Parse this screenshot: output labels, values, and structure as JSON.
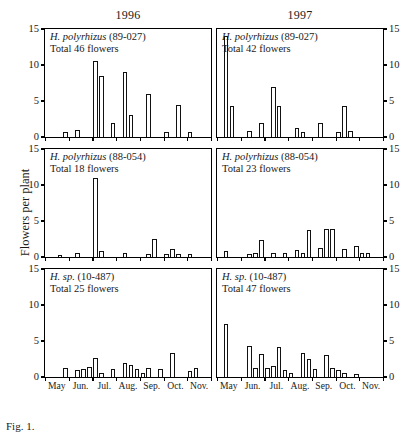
{
  "figure": {
    "ylabel": "Flowers per plant",
    "columns": [
      {
        "key": "c1996",
        "label": "1996"
      },
      {
        "key": "c1997",
        "label": "1997"
      }
    ],
    "caption": "Fig. 1."
  },
  "axis": {
    "yticks": [
      0,
      5,
      10,
      15
    ],
    "ylim": [
      0,
      15
    ],
    "ytick_labels": [
      "0",
      "5",
      "10",
      "15"
    ],
    "months": [
      "May",
      "Jun.",
      "Jul.",
      "Aug.",
      "Sep.",
      "Oct.",
      "Nov."
    ],
    "bins_per_month": 4,
    "xlabel": ""
  },
  "chart_data": {
    "type": "bar",
    "xlabel": "",
    "ylabel": "Flowers per plant",
    "ylim": [
      0,
      15
    ],
    "grid": false,
    "legend": "none",
    "categories": [
      "May-1",
      "May-2",
      "May-3",
      "May-4",
      "Jun-1",
      "Jun-2",
      "Jun-3",
      "Jun-4",
      "Jul-1",
      "Jul-2",
      "Jul-3",
      "Jul-4",
      "Aug-1",
      "Aug-2",
      "Aug-3",
      "Aug-4",
      "Sep-1",
      "Sep-2",
      "Sep-3",
      "Sep-4",
      "Oct-1",
      "Oct-2",
      "Oct-3",
      "Oct-4",
      "Nov-1",
      "Nov-2",
      "Nov-3",
      "Nov-4"
    ],
    "panels": [
      {
        "id": "p-1996-89027",
        "year": "1996",
        "species": "H. polyrhizus",
        "accession": "(89-027)",
        "total_line": "Total 46 flowers",
        "total": 46,
        "values": [
          0,
          0,
          0,
          0.7,
          0,
          1,
          0,
          0,
          10.5,
          8.5,
          0,
          2,
          0,
          9,
          3,
          0,
          0,
          6,
          0,
          0,
          0.7,
          0,
          4.5,
          0,
          0.7,
          0,
          0,
          0
        ]
      },
      {
        "id": "p-1997-89027",
        "year": "1997",
        "species": "H. polyrhizus",
        "accession": "(89-027)",
        "total_line": "Total 42 flowers",
        "total": 42,
        "values": [
          0,
          14,
          4.3,
          0,
          0,
          0.8,
          0,
          2,
          0,
          7,
          4.3,
          0,
          0,
          1.2,
          0.7,
          0,
          0,
          2,
          0,
          0,
          0.7,
          4.3,
          0.8,
          0,
          0,
          0,
          0,
          0
        ]
      },
      {
        "id": "p-1996-88054",
        "year": "1996",
        "species": "H. polyrhizus",
        "accession": "(88-054)",
        "total_line": "Total 18 flowers",
        "total": 18,
        "values": [
          0,
          0,
          0.3,
          0,
          0,
          0.5,
          0,
          0,
          11,
          0.8,
          0,
          0,
          0,
          0.6,
          0,
          0,
          0,
          0.4,
          2.5,
          0,
          0.4,
          1.1,
          0.4,
          0,
          0.4,
          0,
          0,
          0
        ]
      },
      {
        "id": "p-1997-88054",
        "year": "1997",
        "species": "H. polyrhizus",
        "accession": "(88-054)",
        "total_line": "Total 23 flowers",
        "total": 23,
        "values": [
          0,
          0.8,
          0,
          0,
          0,
          0.4,
          0.6,
          2.3,
          0,
          0.5,
          0,
          0.5,
          0,
          1,
          0.5,
          3.7,
          0,
          1.3,
          3.9,
          3.9,
          0,
          1.1,
          0,
          1.5,
          0.5,
          0.6,
          0,
          0
        ]
      },
      {
        "id": "p-1996-10487",
        "year": "1996",
        "species": "H. sp.",
        "accession": "(10-487)",
        "total_line": "Total 25 flowers",
        "total": 25,
        "values": [
          0,
          0,
          0,
          1.2,
          0,
          1,
          1.1,
          1.4,
          2.6,
          0.5,
          0,
          1.1,
          0,
          2,
          1.6,
          1.1,
          0.5,
          1.3,
          0,
          1.1,
          0,
          3.4,
          0,
          0,
          0.9,
          1.2,
          0,
          0
        ]
      },
      {
        "id": "p-1997-10487",
        "year": "1997",
        "species": "H. sp.",
        "accession": "(10-487)",
        "total_line": "Total 47 flowers",
        "total": 47,
        "values": [
          0,
          7.3,
          0,
          0,
          0,
          4.3,
          1.3,
          3.2,
          1.2,
          1.5,
          4.2,
          1,
          0.6,
          0,
          3.4,
          2.5,
          1.1,
          0,
          3,
          1.3,
          1,
          0.5,
          0,
          0.4,
          0,
          0,
          0,
          0
        ]
      }
    ]
  }
}
